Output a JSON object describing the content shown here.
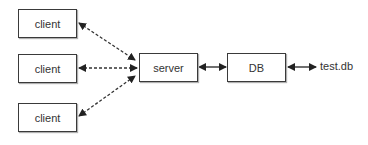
{
  "diagram": {
    "clients": [
      {
        "label": "client"
      },
      {
        "label": "client"
      },
      {
        "label": "client"
      }
    ],
    "server": {
      "label": "server"
    },
    "db": {
      "label": "DB"
    },
    "file": {
      "label": "test.db"
    },
    "edges": [
      {
        "from": "client-1",
        "to": "server",
        "style": "dashed",
        "direction": "bidirectional"
      },
      {
        "from": "client-2",
        "to": "server",
        "style": "dashed",
        "direction": "bidirectional"
      },
      {
        "from": "client-3",
        "to": "server",
        "style": "dashed",
        "direction": "bidirectional"
      },
      {
        "from": "server",
        "to": "DB",
        "style": "solid",
        "direction": "bidirectional"
      },
      {
        "from": "DB",
        "to": "test.db",
        "style": "solid",
        "direction": "bidirectional"
      }
    ]
  }
}
